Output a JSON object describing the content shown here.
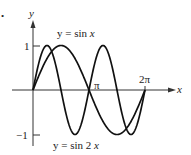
{
  "chart_data": {
    "type": "line",
    "title": "",
    "xlabel": "x",
    "ylabel": "y",
    "xlim": [
      0,
      6.2832
    ],
    "ylim": [
      -1,
      1
    ],
    "x_ticks": [
      "π",
      "2π"
    ],
    "y_ticks": [
      "1",
      "-1"
    ],
    "grid": false,
    "series": [
      {
        "name": "y = sin x",
        "function": "sin(x)",
        "x_range": [
          0,
          6.2832
        ]
      },
      {
        "name": "y = sin 2 x",
        "function": "sin(2x)",
        "x_range": [
          0,
          6.2832
        ]
      }
    ],
    "annotations": [
      "y = sin x",
      "y = sin 2 x"
    ]
  },
  "labels": {
    "bullet": "•",
    "y_axis": "y",
    "x_axis": "x",
    "tick_one": "1",
    "tick_minus_one": "−1",
    "tick_pi": "π",
    "tick_two_pi": "2π",
    "curve1_prefix": "y = sin ",
    "curve1_var": "x",
    "curve2_prefix": "y = sin 2 ",
    "curve2_var": "x"
  }
}
